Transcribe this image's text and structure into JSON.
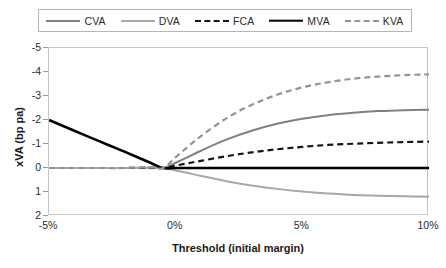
{
  "chart_data": {
    "type": "line",
    "title": "",
    "xlabel": "Threshold (initial margin)",
    "ylabel": "xVA (bp pa)",
    "xlim": [
      -5,
      10
    ],
    "ylim": [
      -5,
      2
    ],
    "y_inverted": true,
    "grid": false,
    "legend_position": "top",
    "x_tick_labels": [
      "-5%",
      "0%",
      "5%",
      "10%"
    ],
    "x_ticks": [
      -5,
      0,
      5,
      10
    ],
    "y_tick_labels": [
      "-5",
      "-4",
      "-3",
      "-2",
      "-1",
      "0",
      "1",
      "2"
    ],
    "y_ticks": [
      -5,
      -4,
      -3,
      -2,
      -1,
      0,
      1,
      2
    ],
    "x": [
      -5,
      -4,
      -3,
      -2,
      -1,
      -0.5,
      0,
      0.5,
      1,
      2,
      3,
      4,
      5,
      6,
      7,
      8,
      9,
      10
    ],
    "series": [
      {
        "name": "CVA",
        "color": "#808080",
        "dash": "none",
        "width": 2.0,
        "values": [
          0,
          0,
          0,
          0,
          -0.02,
          0,
          -0.22,
          -0.46,
          -0.72,
          -1.18,
          -1.55,
          -1.84,
          -2.05,
          -2.2,
          -2.3,
          -2.37,
          -2.41,
          -2.43
        ]
      },
      {
        "name": "DVA",
        "color": "#a8a8a8",
        "dash": "none",
        "width": 2.0,
        "values": [
          0,
          0,
          0,
          0,
          0.01,
          0,
          0.1,
          0.21,
          0.33,
          0.55,
          0.73,
          0.87,
          0.98,
          1.06,
          1.12,
          1.16,
          1.18,
          1.2
        ]
      },
      {
        "name": "FCA",
        "color": "#141414",
        "dash": "dashed",
        "width": 2.2,
        "values": [
          0,
          0,
          0,
          0,
          -0.01,
          0,
          -0.1,
          -0.2,
          -0.3,
          -0.49,
          -0.65,
          -0.78,
          -0.88,
          -0.96,
          -1.01,
          -1.05,
          -1.08,
          -1.1
        ]
      },
      {
        "name": "MVA",
        "color": "#000000",
        "dash": "none",
        "width": 2.6,
        "values": [
          -2.0,
          -1.55,
          -1.11,
          -0.67,
          -0.22,
          0,
          0,
          0,
          0,
          0,
          0,
          0,
          0,
          0,
          0,
          0,
          0,
          0
        ]
      },
      {
        "name": "KVA",
        "color": "#939393",
        "dash": "dashed",
        "width": 2.2,
        "values": [
          0,
          0,
          0,
          0,
          -0.03,
          0,
          -0.45,
          -0.9,
          -1.33,
          -2.07,
          -2.63,
          -3.05,
          -3.36,
          -3.57,
          -3.72,
          -3.81,
          -3.87,
          -3.9
        ]
      }
    ]
  },
  "legend": {
    "entries": [
      {
        "label": "CVA"
      },
      {
        "label": "DVA"
      },
      {
        "label": "FCA"
      },
      {
        "label": "MVA"
      },
      {
        "label": "KVA"
      }
    ]
  },
  "axes": {
    "y_title": "xVA (bp pa)",
    "x_title": "Threshold (initial margin)"
  }
}
